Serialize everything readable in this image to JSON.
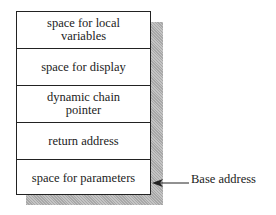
{
  "diagram": {
    "cells": [
      {
        "label": "space for local variables"
      },
      {
        "label": "space for display"
      },
      {
        "label": "dynamic chain pointer"
      },
      {
        "label": "return address"
      },
      {
        "label": "space for parameters"
      }
    ],
    "pointer_label": "Base address"
  }
}
